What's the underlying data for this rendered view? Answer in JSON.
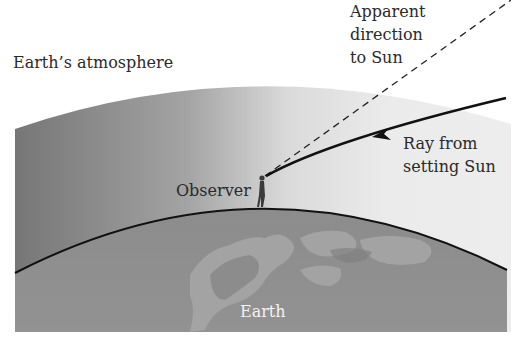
{
  "diagram": {
    "labels": {
      "atmosphere": "Earth’s atmosphere",
      "apparent_direction": [
        "Apparent",
        "direction",
        "to Sun"
      ],
      "ray": [
        "Ray from",
        "setting Sun"
      ],
      "observer": "Observer",
      "earth": "Earth"
    },
    "elements": {
      "atmosphere_layer": "atmosphere-gradient",
      "earth_surface": "earth-surface-curve",
      "observer_figure": "person-figure",
      "refracted_ray": "solid-curved-ray-with-arrow",
      "apparent_direction_line": "dashed-straight-line"
    },
    "colors": {
      "atmosphere_dark": "#7a7a7a",
      "atmosphere_light": "#ececec",
      "earth_fill": "#8e8e8e",
      "land_fill": "#a3a3a3",
      "surface_line": "#111111",
      "ray": "#111111",
      "text": "#2a2a2a",
      "text_on_earth": "#f2f2f2"
    }
  }
}
